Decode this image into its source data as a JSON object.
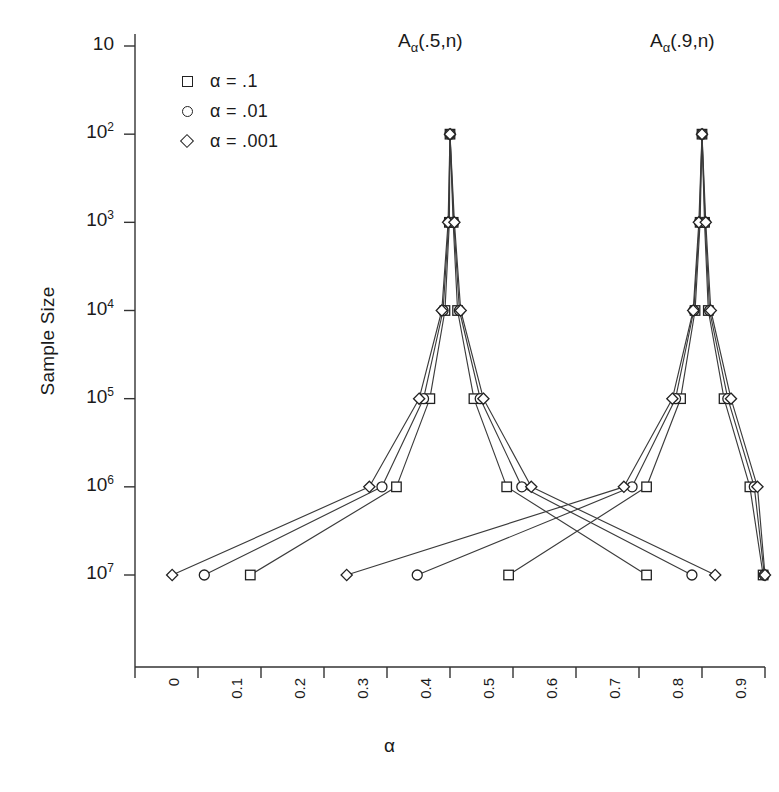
{
  "chart_data": {
    "type": "line",
    "title": "",
    "xlabel": "α",
    "ylabel": "Sample Size",
    "xlim": [
      0,
      1
    ],
    "ylim_log10": [
      1,
      7
    ],
    "yscale": "log",
    "grid": false,
    "legend_position": "upper-left",
    "x_ticks": [
      "0",
      "0.1",
      "0.2",
      "0.3",
      "0.4",
      "0.5",
      "0.6",
      "0.7",
      "0.8",
      "0.9",
      "1"
    ],
    "x_tick_values": [
      0,
      0.1,
      0.2,
      0.3,
      0.4,
      0.5,
      0.6,
      0.7,
      0.8,
      0.9,
      1
    ],
    "y_ticks": [
      "10",
      "10^2",
      "10^3",
      "10^4",
      "10^5",
      "10^6",
      "10^7"
    ],
    "y_tick_values": [
      10,
      100,
      1000,
      10000,
      100000,
      1000000,
      10000000
    ],
    "y_tick_mantissa": "10",
    "y_tick_exponents": [
      "7",
      "6",
      "5",
      "4",
      "3",
      "2",
      ""
    ],
    "annotations": [
      {
        "text": "A",
        "sub": "α",
        "rest": "(.5,n)",
        "x": 0.5,
        "y": 6000000
      },
      {
        "text": "A",
        "sub": "α",
        "rest": "(.9,n)",
        "x": 0.9,
        "y": 6000000
      }
    ],
    "legend": [
      {
        "marker": "square",
        "label": "α  = .1"
      },
      {
        "marker": "circle",
        "label": "α  = .01"
      },
      {
        "marker": "diamond",
        "label": "α  = .001"
      }
    ],
    "series": [
      {
        "name": "α = .1",
        "marker": "square",
        "points": [
          {
            "x": 0.183,
            "y": 10
          },
          {
            "x": 0.415,
            "y": 100
          },
          {
            "x": 0.468,
            "y": 1000
          },
          {
            "x": 0.492,
            "y": 10000
          },
          {
            "x": 0.499,
            "y": 100000
          },
          {
            "x": 0.5,
            "y": 1000000
          },
          {
            "x": 0.505,
            "y": 100000
          },
          {
            "x": 0.512,
            "y": 10000
          },
          {
            "x": 0.538,
            "y": 1000
          },
          {
            "x": 0.59,
            "y": 100
          },
          {
            "x": 0.812,
            "y": 10
          }
        ]
      },
      {
        "name": "α = .1 (second peak)",
        "marker": "square",
        "points": [
          {
            "x": 0.593,
            "y": 10
          },
          {
            "x": 0.812,
            "y": 100
          },
          {
            "x": 0.866,
            "y": 1000
          },
          {
            "x": 0.889,
            "y": 10000
          },
          {
            "x": 0.897,
            "y": 100000
          },
          {
            "x": 0.9,
            "y": 1000000
          },
          {
            "x": 0.904,
            "y": 100000
          },
          {
            "x": 0.91,
            "y": 10000
          },
          {
            "x": 0.935,
            "y": 1000
          },
          {
            "x": 0.976,
            "y": 100
          },
          {
            "x": 0.997,
            "y": 10
          }
        ]
      },
      {
        "name": "α = .01",
        "marker": "circle",
        "points": [
          {
            "x": 0.11,
            "y": 10
          },
          {
            "x": 0.392,
            "y": 100
          },
          {
            "x": 0.458,
            "y": 1000
          },
          {
            "x": 0.489,
            "y": 10000
          },
          {
            "x": 0.498,
            "y": 100000
          },
          {
            "x": 0.5,
            "y": 1000000
          },
          {
            "x": 0.506,
            "y": 100000
          },
          {
            "x": 0.515,
            "y": 10000
          },
          {
            "x": 0.548,
            "y": 1000
          },
          {
            "x": 0.614,
            "y": 100
          },
          {
            "x": 0.884,
            "y": 10
          }
        ]
      },
      {
        "name": "α = .01 (second peak)",
        "marker": "circle",
        "points": [
          {
            "x": 0.448,
            "y": 10
          },
          {
            "x": 0.789,
            "y": 100
          },
          {
            "x": 0.858,
            "y": 1000
          },
          {
            "x": 0.887,
            "y": 10000
          },
          {
            "x": 0.896,
            "y": 100000
          },
          {
            "x": 0.9,
            "y": 1000000
          },
          {
            "x": 0.905,
            "y": 100000
          },
          {
            "x": 0.912,
            "y": 10000
          },
          {
            "x": 0.941,
            "y": 1000
          },
          {
            "x": 0.983,
            "y": 100
          },
          {
            "x": 0.999,
            "y": 10
          }
        ]
      },
      {
        "name": "α = .001",
        "marker": "diamond",
        "points": [
          {
            "x": 0.059,
            "y": 10
          },
          {
            "x": 0.372,
            "y": 100
          },
          {
            "x": 0.451,
            "y": 1000
          },
          {
            "x": 0.487,
            "y": 10000
          },
          {
            "x": 0.497,
            "y": 100000
          },
          {
            "x": 0.5,
            "y": 1000000
          },
          {
            "x": 0.507,
            "y": 100000
          },
          {
            "x": 0.517,
            "y": 10000
          },
          {
            "x": 0.553,
            "y": 1000
          },
          {
            "x": 0.629,
            "y": 100
          },
          {
            "x": 0.921,
            "y": 10
          }
        ]
      },
      {
        "name": "α = .001 (second peak)",
        "marker": "diamond",
        "points": [
          {
            "x": 0.336,
            "y": 10
          },
          {
            "x": 0.776,
            "y": 100
          },
          {
            "x": 0.853,
            "y": 1000
          },
          {
            "x": 0.886,
            "y": 10000
          },
          {
            "x": 0.895,
            "y": 100000
          },
          {
            "x": 0.9,
            "y": 1000000
          },
          {
            "x": 0.906,
            "y": 100000
          },
          {
            "x": 0.914,
            "y": 10000
          },
          {
            "x": 0.946,
            "y": 1000
          },
          {
            "x": 0.988,
            "y": 100
          },
          {
            "x": 1.0,
            "y": 10
          }
        ]
      }
    ],
    "colors": {
      "line": "#3b3b3b",
      "marker_edge": "#222222",
      "marker_fill": "#ffffff",
      "axis": "#333333",
      "text": "#1a1a1a",
      "background": "#ffffff"
    }
  }
}
